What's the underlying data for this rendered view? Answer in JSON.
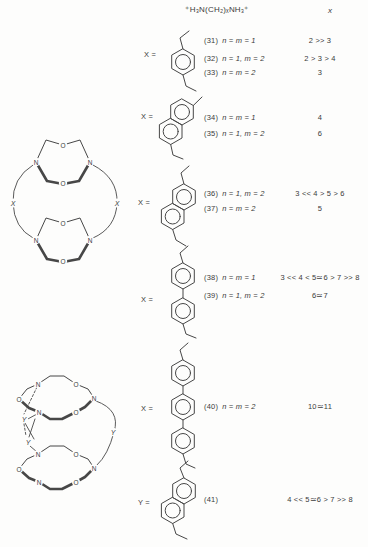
{
  "colors": {
    "ink": "#3b3b3b",
    "paper": "#fdfdfc"
  },
  "header": {
    "guest_formula": "⁺H₃N(CH₂)ₓNH₃⁺",
    "selectivity_column_label": "x"
  },
  "structures": {
    "cylinder": {
      "rings": [
        {
          "atoms": [
            "O",
            "N",
            "N",
            "O"
          ]
        },
        {
          "atoms": [
            "O",
            "N",
            "N",
            "O"
          ]
        }
      ],
      "linkers": [
        "X",
        "X"
      ]
    },
    "cage": {
      "rings": [
        {
          "atoms": [
            "N",
            "O",
            "O",
            "N",
            "N",
            "O"
          ]
        },
        {
          "atoms": [
            "N",
            "O",
            "O",
            "N",
            "N",
            "O"
          ]
        }
      ],
      "linkers": [
        "Y",
        "Y",
        "Y"
      ]
    }
  },
  "blocks": [
    {
      "x_label": "X =",
      "structure": "para-xylylene",
      "rows": [
        {
          "id": "(31)",
          "condition": "n = m = 1",
          "selectivity": "2 >> 3"
        },
        {
          "id": "(32)",
          "condition": "n = 1, m = 2",
          "selectivity": "2 > 3 > 4"
        },
        {
          "id": "(33)",
          "condition": "n = m = 2",
          "selectivity": "3"
        }
      ]
    },
    {
      "x_label": "X =",
      "structure": "naphthalene-2,6-diyl",
      "rows": [
        {
          "id": "(34)",
          "condition": "n = m = 1",
          "selectivity": "4"
        },
        {
          "id": "(35)",
          "condition": "n = 1, m = 2",
          "selectivity": "6"
        }
      ]
    },
    {
      "x_label": "X =",
      "structure": "naphthalene-2,6-diyl",
      "rows": [
        {
          "id": "(36)",
          "condition": "n = 1, m = 2",
          "selectivity": "3 << 4 > 5 > 6"
        },
        {
          "id": "(37)",
          "condition": "n = m = 2",
          "selectivity": "5"
        }
      ]
    },
    {
      "x_label": "X =",
      "structure": "biphenyl-4,4'-diyl",
      "rows": [
        {
          "id": "(38)",
          "condition": "n = m = 1",
          "selectivity": "3 << 4 < 5≃6 > 7 >> 8"
        },
        {
          "id": "(39)",
          "condition": "n = 1, m = 2",
          "selectivity": "6≃7"
        }
      ]
    },
    {
      "x_label": "X =",
      "structure": "p-terphenyl-4,4''-diyl",
      "rows": [
        {
          "id": "(40)",
          "condition": "n = m = 2",
          "selectivity": "10≃11"
        }
      ]
    },
    {
      "x_label": "Y =",
      "structure": "naphthalene-2,6-diyl-diethylene",
      "rows": [
        {
          "id": "(41)",
          "condition": "",
          "selectivity": "4 << 5≃6 > 7 >> 8"
        }
      ]
    }
  ]
}
